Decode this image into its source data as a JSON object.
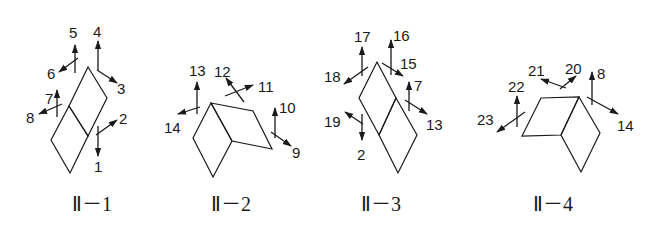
{
  "figures": [
    {
      "id": "II-1",
      "caption": "Ⅱ－1",
      "caption_pos": [
        72,
        211
      ],
      "polygons": [
        [
          [
            88,
            67
          ],
          [
            107,
            98
          ],
          [
            88,
            136
          ],
          [
            69,
            106
          ]
        ],
        [
          [
            69,
            106
          ],
          [
            88,
            136
          ],
          [
            70,
            173
          ],
          [
            51,
            140
          ]
        ]
      ],
      "arrows": [
        {
          "label": "1",
          "from": [
            98,
            126
          ],
          "to": [
            98,
            156
          ],
          "label_pos": [
            94,
            172
          ]
        },
        {
          "label": "2",
          "from": [
            96,
            135
          ],
          "to": [
            117,
            120
          ],
          "label_pos": [
            119,
            124
          ]
        },
        {
          "label": "3",
          "from": [
            97,
            70
          ],
          "to": [
            117,
            83
          ],
          "label_pos": [
            117,
            94
          ]
        },
        {
          "label": "4",
          "from": [
            98,
            70
          ],
          "to": [
            98,
            41
          ],
          "label_pos": [
            93,
            37
          ]
        },
        {
          "label": "5",
          "from": [
            75,
            73
          ],
          "to": [
            75,
            45
          ],
          "label_pos": [
            69,
            38
          ]
        },
        {
          "label": "6",
          "from": [
            78,
            58
          ],
          "to": [
            59,
            72
          ],
          "label_pos": [
            47,
            79
          ]
        },
        {
          "label": "7",
          "from": [
            57,
            117
          ],
          "to": [
            57,
            90
          ],
          "label_pos": [
            45,
            104
          ]
        },
        {
          "label": "8",
          "from": [
            62,
            104
          ],
          "to": [
            39,
            114
          ],
          "label_pos": [
            26,
            123
          ]
        }
      ]
    },
    {
      "id": "II-2",
      "caption": "Ⅱ－2",
      "caption_pos": [
        211,
        211
      ],
      "polygons": [
        [
          [
            211,
            103
          ],
          [
            253,
            111
          ],
          [
            272,
            149
          ],
          [
            232,
            141
          ]
        ],
        [
          [
            211,
            103
          ],
          [
            232,
            141
          ],
          [
            213,
            177
          ],
          [
            193,
            138
          ]
        ]
      ],
      "arrows": [
        {
          "label": "9",
          "from": [
            271,
            132
          ],
          "to": [
            291,
            146
          ],
          "label_pos": [
            292,
            158
          ]
        },
        {
          "label": "10",
          "from": [
            275,
            138
          ],
          "to": [
            275,
            108
          ],
          "label_pos": [
            279,
            113
          ]
        },
        {
          "label": "11",
          "from": [
            225,
            96
          ],
          "to": [
            253,
            85
          ],
          "label_pos": [
            258,
            92
          ]
        },
        {
          "label": "12",
          "from": [
            244,
            102
          ],
          "to": [
            226,
            78
          ],
          "label_pos": [
            214,
            77
          ]
        },
        {
          "label": "13",
          "from": [
            197,
            114
          ],
          "to": [
            197,
            82
          ],
          "label_pos": [
            189,
            76
          ]
        },
        {
          "label": "14",
          "from": [
            200,
            107
          ],
          "to": [
            178,
            114
          ],
          "label_pos": [
            164,
            133
          ]
        }
      ]
    },
    {
      "id": "II-3",
      "caption": "Ⅱ－3",
      "caption_pos": [
        361,
        211
      ],
      "polygons": [
        [
          [
            377,
            62
          ],
          [
            396,
            98
          ],
          [
            379,
            135
          ],
          [
            359,
            98
          ]
        ],
        [
          [
            396,
            98
          ],
          [
            417,
            135
          ],
          [
            398,
            173
          ],
          [
            379,
            135
          ]
        ]
      ],
      "arrows": [
        {
          "label": "2",
          "from": [
            362,
            114
          ],
          "to": [
            362,
            140
          ],
          "label_pos": [
            357,
            160
          ]
        },
        {
          "label": "19",
          "from": [
            363,
            124
          ],
          "to": [
            345,
            112
          ],
          "label_pos": [
            324,
            127
          ]
        },
        {
          "label": "18",
          "from": [
            368,
            67
          ],
          "to": [
            344,
            84
          ],
          "label_pos": [
            324,
            82
          ]
        },
        {
          "label": "17",
          "from": [
            362,
            76
          ],
          "to": [
            362,
            47
          ],
          "label_pos": [
            354,
            42
          ]
        },
        {
          "label": "16",
          "from": [
            391,
            75
          ],
          "to": [
            391,
            40
          ],
          "label_pos": [
            393,
            41
          ]
        },
        {
          "label": "15",
          "from": [
            382,
            63
          ],
          "to": [
            403,
            76
          ],
          "label_pos": [
            400,
            69
          ]
        },
        {
          "label": "7",
          "from": [
            409,
            111
          ],
          "to": [
            409,
            82
          ],
          "label_pos": [
            414,
            91
          ]
        },
        {
          "label": "13",
          "from": [
            405,
            100
          ],
          "to": [
            427,
            114
          ],
          "label_pos": [
            426,
            130
          ]
        }
      ]
    },
    {
      "id": "II-4",
      "caption": "Ⅱ－4",
      "caption_pos": [
        533,
        211
      ],
      "polygons": [
        [
          [
            541,
            98
          ],
          [
            579,
            97
          ],
          [
            561,
            135
          ],
          [
            522,
            136
          ]
        ],
        [
          [
            579,
            97
          ],
          [
            600,
            133
          ],
          [
            581,
            172
          ],
          [
            561,
            135
          ]
        ]
      ],
      "arrows": [
        {
          "label": "8",
          "from": [
            592,
            105
          ],
          "to": [
            592,
            72
          ],
          "label_pos": [
            597,
            79
          ]
        },
        {
          "label": "14",
          "from": [
            587,
            97
          ],
          "to": [
            618,
            114
          ],
          "label_pos": [
            617,
            131
          ]
        },
        {
          "label": "20",
          "from": [
            560,
            89
          ],
          "to": [
            576,
            76
          ],
          "label_pos": [
            565,
            74
          ]
        },
        {
          "label": "21",
          "from": [
            566,
            88
          ],
          "to": [
            541,
            79
          ],
          "label_pos": [
            528,
            76
          ]
        },
        {
          "label": "22",
          "from": [
            517,
            127
          ],
          "to": [
            517,
            96
          ],
          "label_pos": [
            508,
            92
          ]
        },
        {
          "label": "23",
          "from": [
            525,
            112
          ],
          "to": [
            497,
            132
          ],
          "label_pos": [
            477,
            125
          ]
        }
      ]
    }
  ],
  "colors": {
    "stroke": "#1a1a1a",
    "background": "#ffffff"
  }
}
